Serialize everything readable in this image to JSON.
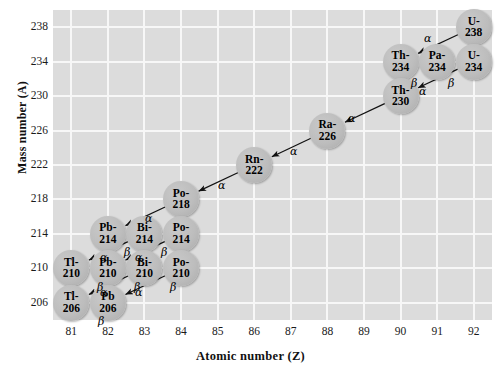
{
  "chart_data": {
    "type": "scatter",
    "title": "",
    "xlabel": "Atomic number (Z)",
    "ylabel": "Mass number (A)",
    "xlim": [
      80.5,
      92.5
    ],
    "ylim": [
      204,
      240
    ],
    "xticks": [
      81,
      82,
      83,
      84,
      85,
      86,
      87,
      88,
      89,
      90,
      91,
      92
    ],
    "yticks": [
      206,
      210,
      214,
      218,
      222,
      226,
      230,
      234,
      238
    ],
    "grid": true,
    "legend": "none",
    "node_fill": "#bdbdbd",
    "plot_background": "#dcdcdc",
    "gridline_color": "#f7f7f7",
    "nodes": [
      {
        "id": "u238",
        "label_line1": "U-",
        "label_line2": "238",
        "z": 92,
        "a": 238
      },
      {
        "id": "th234",
        "label_line1": "Th-",
        "label_line2": "234",
        "z": 90,
        "a": 234
      },
      {
        "id": "pa234",
        "label_line1": "Pa-",
        "label_line2": "234",
        "z": 91,
        "a": 234
      },
      {
        "id": "u234",
        "label_line1": "U-",
        "label_line2": "234",
        "z": 92,
        "a": 234
      },
      {
        "id": "th230",
        "label_line1": "Th-",
        "label_line2": "230",
        "z": 90,
        "a": 230
      },
      {
        "id": "ra226",
        "label_line1": "Ra-",
        "label_line2": "226",
        "z": 88,
        "a": 226
      },
      {
        "id": "rn222",
        "label_line1": "Rn-",
        "label_line2": "222",
        "z": 86,
        "a": 222
      },
      {
        "id": "po218",
        "label_line1": "Po-",
        "label_line2": "218",
        "z": 84,
        "a": 218
      },
      {
        "id": "pb214",
        "label_line1": "Pb-",
        "label_line2": "214",
        "z": 82,
        "a": 214
      },
      {
        "id": "bi214",
        "label_line1": "Bi-",
        "label_line2": "214",
        "z": 83,
        "a": 214
      },
      {
        "id": "po214",
        "label_line1": "Po-",
        "label_line2": "214",
        "z": 84,
        "a": 214
      },
      {
        "id": "tl210",
        "label_line1": "Tl-",
        "label_line2": "210",
        "z": 81,
        "a": 210
      },
      {
        "id": "pb210",
        "label_line1": "Pb-",
        "label_line2": "210",
        "z": 82,
        "a": 210
      },
      {
        "id": "bi210",
        "label_line1": "Bi-",
        "label_line2": "210",
        "z": 83,
        "a": 210
      },
      {
        "id": "po210",
        "label_line1": "Po-",
        "label_line2": "210",
        "z": 84,
        "a": 210
      },
      {
        "id": "tl206",
        "label_line1": "Tl-",
        "label_line2": "206",
        "z": 81,
        "a": 206
      },
      {
        "id": "pb206",
        "label_line1": "Pb",
        "label_line2": "206",
        "z": 82,
        "a": 206
      }
    ],
    "decays": [
      {
        "from": "u238",
        "to": "th234",
        "type": "alpha"
      },
      {
        "from": "th234",
        "to": "pa234",
        "type": "beta"
      },
      {
        "from": "pa234",
        "to": "u234",
        "type": "beta"
      },
      {
        "from": "u234",
        "to": "th230",
        "type": "alpha"
      },
      {
        "from": "th230",
        "to": "ra226",
        "type": "alpha"
      },
      {
        "from": "ra226",
        "to": "rn222",
        "type": "alpha"
      },
      {
        "from": "rn222",
        "to": "po218",
        "type": "alpha"
      },
      {
        "from": "po218",
        "to": "pb214",
        "type": "alpha"
      },
      {
        "from": "pb214",
        "to": "bi214",
        "type": "beta"
      },
      {
        "from": "bi214",
        "to": "po214",
        "type": "beta"
      },
      {
        "from": "bi214",
        "to": "tl210",
        "type": "alpha"
      },
      {
        "from": "po214",
        "to": "pb210",
        "type": "alpha"
      },
      {
        "from": "tl210",
        "to": "pb210",
        "type": "beta"
      },
      {
        "from": "pb210",
        "to": "bi210",
        "type": "beta"
      },
      {
        "from": "bi210",
        "to": "po210",
        "type": "beta"
      },
      {
        "from": "bi210",
        "to": "tl206",
        "type": "alpha"
      },
      {
        "from": "po210",
        "to": "pb206",
        "type": "alpha"
      },
      {
        "from": "tl206",
        "to": "pb206",
        "type": "beta"
      }
    ],
    "symbols": {
      "alpha": "α",
      "beta": "β"
    }
  },
  "axes": {
    "x_title": "Atomic number (Z)",
    "y_title": "Mass number (A)",
    "x_tick_labels": [
      "81",
      "82",
      "83",
      "84",
      "85",
      "86",
      "87",
      "88",
      "89",
      "90",
      "91",
      "92"
    ],
    "y_tick_labels": [
      "238",
      "234",
      "230",
      "226",
      "222",
      "218",
      "214",
      "210",
      "206"
    ]
  },
  "decay_labels": [
    {
      "id": "a_u238_th234",
      "text": "α"
    },
    {
      "id": "b_th234_pa234",
      "text": "β"
    },
    {
      "id": "b_pa234_u234",
      "text": "β"
    },
    {
      "id": "a_u234_th230",
      "text": "α"
    },
    {
      "id": "a_th230_ra226",
      "text": "α"
    },
    {
      "id": "a_ra226_rn222",
      "text": "α"
    },
    {
      "id": "a_rn222_po218",
      "text": "α"
    },
    {
      "id": "a_po218_pb214",
      "text": "α"
    },
    {
      "id": "b_pb214_bi214",
      "text": "β"
    },
    {
      "id": "b_bi214_po214",
      "text": "β"
    },
    {
      "id": "a_bi214_tl210",
      "text": "α"
    },
    {
      "id": "a_po214_pb210",
      "text": "α"
    },
    {
      "id": "b_tl210_pb210",
      "text": "β"
    },
    {
      "id": "b_pb210_bi210",
      "text": "β"
    },
    {
      "id": "b_bi210_po210",
      "text": "β"
    },
    {
      "id": "a_bi210_tl206",
      "text": "α"
    },
    {
      "id": "a_po210_pb206",
      "text": "α"
    },
    {
      "id": "b_tl206_pb206",
      "text": "β"
    }
  ]
}
